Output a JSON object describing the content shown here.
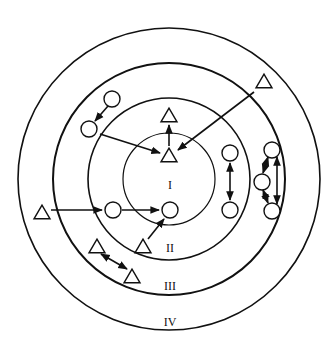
{
  "diagram": {
    "type": "concentric-zones",
    "center": [
      169,
      179
    ],
    "rings": [
      {
        "id": "I",
        "label": "I",
        "r": 46,
        "stroke": 1.2,
        "label_pos": [
          170,
          189
        ]
      },
      {
        "id": "II",
        "label": "II",
        "r": 81,
        "stroke": 1.6,
        "label_pos": [
          170,
          252
        ]
      },
      {
        "id": "III",
        "label": "III",
        "r": 116,
        "stroke": 2.0,
        "label_pos": [
          170,
          290
        ]
      },
      {
        "id": "IV",
        "label": "IV",
        "r": 151,
        "stroke": 1.6,
        "label_pos": [
          170,
          326
        ]
      }
    ],
    "colors": {
      "stroke": "#111111",
      "background": "#ffffff"
    },
    "nodes": [
      {
        "id": "c1",
        "shape": "circle",
        "x": 112,
        "y": 99,
        "r": 8
      },
      {
        "id": "c2",
        "shape": "circle",
        "x": 89,
        "y": 129,
        "r": 8
      },
      {
        "id": "c3",
        "shape": "circle",
        "x": 113,
        "y": 210,
        "r": 8
      },
      {
        "id": "c4",
        "shape": "circle",
        "x": 170,
        "y": 210,
        "r": 8
      },
      {
        "id": "c5",
        "shape": "circle",
        "x": 230,
        "y": 153,
        "r": 8
      },
      {
        "id": "c6",
        "shape": "circle",
        "x": 230,
        "y": 210,
        "r": 8
      },
      {
        "id": "c7",
        "shape": "circle",
        "x": 272,
        "y": 150,
        "r": 8
      },
      {
        "id": "c8",
        "shape": "circle",
        "x": 262,
        "y": 182,
        "r": 8
      },
      {
        "id": "c9",
        "shape": "circle",
        "x": 272,
        "y": 211,
        "r": 8
      },
      {
        "id": "t1",
        "shape": "triangle",
        "x": 169,
        "y": 115,
        "size": 16
      },
      {
        "id": "t2",
        "shape": "triangle",
        "x": 169,
        "y": 155,
        "size": 16
      },
      {
        "id": "t3",
        "shape": "triangle",
        "x": 264,
        "y": 81,
        "size": 16
      },
      {
        "id": "t4",
        "shape": "triangle",
        "x": 42,
        "y": 212,
        "size": 16
      },
      {
        "id": "t5",
        "shape": "triangle",
        "x": 143,
        "y": 246,
        "size": 16
      },
      {
        "id": "t6",
        "shape": "triangle",
        "x": 97,
        "y": 246,
        "size": 16
      },
      {
        "id": "t7",
        "shape": "triangle",
        "x": 132,
        "y": 276,
        "size": 16
      }
    ],
    "edges": [
      {
        "from": [
          108,
          106
        ],
        "to": [
          95,
          121
        ],
        "dir": "forward"
      },
      {
        "from": [
          100,
          134
        ],
        "to": [
          160,
          153
        ],
        "dir": "forward"
      },
      {
        "from": [
          169,
          146
        ],
        "to": [
          169,
          125
        ],
        "dir": "forward"
      },
      {
        "from": [
          254,
          92
        ],
        "to": [
          178,
          150
        ],
        "dir": "forward"
      },
      {
        "from": [
          51,
          210
        ],
        "to": [
          102,
          210
        ],
        "dir": "forward"
      },
      {
        "from": [
          122,
          210
        ],
        "to": [
          159,
          210
        ],
        "dir": "forward"
      },
      {
        "from": [
          148,
          239
        ],
        "to": [
          164,
          219
        ],
        "dir": "forward"
      },
      {
        "from": [
          230,
          163
        ],
        "to": [
          230,
          200
        ],
        "dir": "both"
      },
      {
        "from": [
          101,
          254
        ],
        "to": [
          127,
          269
        ],
        "dir": "both"
      },
      {
        "from": [
          268,
          157
        ],
        "to": [
          263,
          173
        ],
        "dir": "both"
      },
      {
        "from": [
          263,
          190
        ],
        "to": [
          268,
          203
        ],
        "dir": "both"
      },
      {
        "from": [
          277,
          157
        ],
        "to": [
          277,
          204
        ],
        "dir": "both"
      }
    ]
  }
}
